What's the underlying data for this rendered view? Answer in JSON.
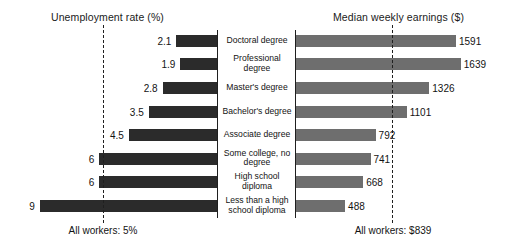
{
  "chart_data": {
    "type": "bar",
    "orientation": "horizontal",
    "layout": "back-to-back paired bar chart with shared centered category labels",
    "grid": false,
    "legend": null,
    "categories": [
      "Doctoral degree",
      "Professional degree",
      "Master's degree",
      "Bachelor's degree",
      "Associate degree",
      "Some college, no degree",
      "High school diploma",
      "Less than a high school diploma"
    ],
    "panels": [
      {
        "id": "unemployment",
        "title": "Unemployment rate (%)",
        "xlabel": "",
        "ylabel": "",
        "direction": "right-to-left",
        "bar_color": "#2b2b2b",
        "xlim": [
          0,
          9.6
        ],
        "values": [
          2.1,
          1.9,
          2.8,
          3.5,
          4.5,
          6.0,
          6.0,
          9.0
        ],
        "value_labels": [
          "2.1",
          "1.9",
          "2.8",
          "3.5",
          "4.5",
          "6",
          "6",
          "9"
        ],
        "reference_line": {
          "value": 5,
          "label": "All workers: 5%",
          "style": "dash-dot"
        }
      },
      {
        "id": "earnings",
        "title": "Median weekly earnings ($)",
        "xlabel": "",
        "ylabel": "",
        "direction": "left-to-right",
        "bar_color": "#6e6e6e",
        "xlim": [
          0,
          1800
        ],
        "values": [
          1591,
          1639,
          1326,
          1101,
          792,
          741,
          668,
          488
        ],
        "value_labels": [
          "1591",
          "1639",
          "1326",
          "1101",
          "792",
          "741",
          "668",
          "488"
        ],
        "reference_line": {
          "value": 839,
          "label": "All workers: $839",
          "style": "dash-dot"
        }
      }
    ]
  },
  "titles": {
    "left": "Unemployment rate (%)",
    "right": "Median weekly earnings ($)"
  },
  "footers": {
    "left": "All workers: 5%",
    "right": "All workers: $839"
  },
  "rows": [
    {
      "category": "Doctoral degree",
      "unemployment": "2.1",
      "earnings": "1591"
    },
    {
      "category": "Professional degree",
      "unemployment": "1.9",
      "earnings": "1639"
    },
    {
      "category": "Master's degree",
      "unemployment": "2.8",
      "earnings": "1326"
    },
    {
      "category": "Bachelor's degree",
      "unemployment": "3.5",
      "earnings": "1101"
    },
    {
      "category": "Associate degree",
      "unemployment": "4.5",
      "earnings": "792"
    },
    {
      "category": "Some college, no degree",
      "unemployment": "6",
      "earnings": "741"
    },
    {
      "category": "High school diploma",
      "unemployment": "6",
      "earnings": "668"
    },
    {
      "category": "Less than a high school diploma",
      "unemployment": "9",
      "earnings": "488"
    }
  ]
}
